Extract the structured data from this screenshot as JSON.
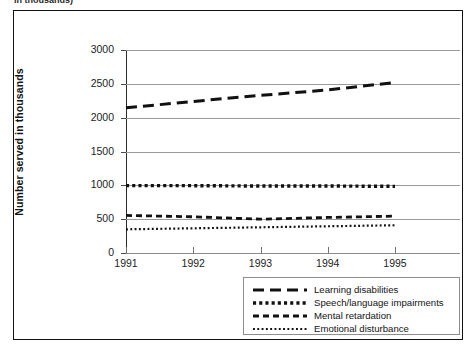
{
  "clipped_caption": "in thousands)",
  "chart_data": {
    "type": "line",
    "title": "",
    "xlabel": "",
    "ylabel": "Number served in thousands",
    "x": [
      1991,
      1992,
      1993,
      1994,
      1995
    ],
    "xtick_labels": [
      "1991",
      "1992",
      "1993",
      "1994",
      "1995"
    ],
    "ytick_labels": [
      "0",
      "500",
      "1000",
      "1500",
      "2000",
      "2500",
      "3000"
    ],
    "ytick_values": [
      0,
      500,
      1000,
      1500,
      2000,
      2500,
      3000
    ],
    "ylim": [
      0,
      3000
    ],
    "xlim": [
      1991,
      1995
    ],
    "grid": true,
    "legend_position": "below-right",
    "series": [
      {
        "name": "Learning disabilities",
        "style": "long-dash",
        "color": "#111111",
        "values": [
          2145,
          2240,
          2330,
          2410,
          2520
        ]
      },
      {
        "name": "Speech/language impairments",
        "style": "square-dot",
        "color": "#111111",
        "values": [
          995,
          995,
          990,
          990,
          985
        ]
      },
      {
        "name": "Mental retardation",
        "style": "short-dash",
        "color": "#111111",
        "values": [
          555,
          535,
          500,
          525,
          545
        ]
      },
      {
        "name": "Emotional disturbance",
        "style": "fine-dot",
        "color": "#111111",
        "values": [
          350,
          365,
          380,
          395,
          410
        ]
      }
    ]
  },
  "legend": {
    "items": [
      {
        "label": "Learning disabilities",
        "style": "long-dash"
      },
      {
        "label": "Speech/language impairments",
        "style": "square-dot"
      },
      {
        "label": "Mental retardation",
        "style": "short-dash"
      },
      {
        "label": "Emotional disturbance",
        "style": "fine-dot"
      }
    ]
  }
}
